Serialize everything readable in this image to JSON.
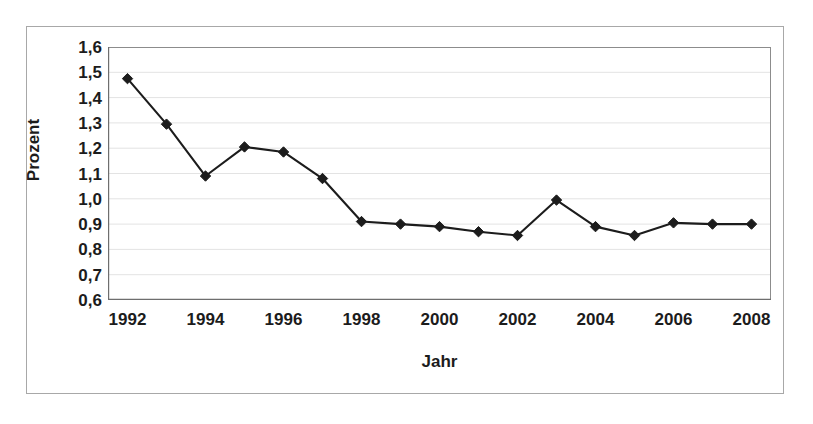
{
  "chart_data": {
    "type": "line",
    "title": "",
    "xlabel": "Jahr",
    "ylabel": "Prozent",
    "xlim": [
      1991.5,
      2008.5
    ],
    "ylim": [
      0.6,
      1.6
    ],
    "grid": true,
    "legend": false,
    "y_tick_labels": [
      "1,6",
      "1,5",
      "1,4",
      "1,3",
      "1,2",
      "1,1",
      "1,0",
      "0,9",
      "0,8",
      "0,7",
      "0,6"
    ],
    "y_tick_values": [
      1.6,
      1.5,
      1.4,
      1.3,
      1.2,
      1.1,
      1.0,
      0.9,
      0.8,
      0.7,
      0.6
    ],
    "x_tick_values": [
      1992,
      1993,
      1994,
      1995,
      1996,
      1997,
      1998,
      1999,
      2000,
      2001,
      2002,
      2003,
      2004,
      2005,
      2006,
      2007,
      2008
    ],
    "x_tick_labels": [
      "1992",
      "",
      "1994",
      "",
      "1996",
      "",
      "1998",
      "",
      "2000",
      "",
      "2002",
      "",
      "2004",
      "",
      "2006",
      "",
      "2008"
    ],
    "categories": [
      1992,
      1993,
      1994,
      1995,
      1996,
      1997,
      1998,
      1999,
      2000,
      2001,
      2002,
      2003,
      2004,
      2005,
      2006,
      2007,
      2008
    ],
    "values": [
      1.475,
      1.295,
      1.09,
      1.205,
      1.185,
      1.08,
      0.91,
      0.9,
      0.89,
      0.87,
      0.855,
      0.995,
      0.89,
      0.855,
      0.905,
      0.9,
      0.9
    ],
    "series": [
      {
        "name": "Prozent",
        "marker": "diamond",
        "color": "#1c1c1c",
        "values": [
          1.475,
          1.295,
          1.09,
          1.205,
          1.185,
          1.08,
          0.91,
          0.9,
          0.89,
          0.87,
          0.855,
          0.995,
          0.89,
          0.855,
          0.905,
          0.9,
          0.9
        ]
      }
    ],
    "colors": {
      "line": "#1c1c1c",
      "marker": "#111111",
      "grid": "#e3e3e3",
      "axis": "#8c8c8c",
      "frame": "#a8a8a8",
      "background": "#ffffff",
      "text": "#1c1c1c"
    }
  }
}
